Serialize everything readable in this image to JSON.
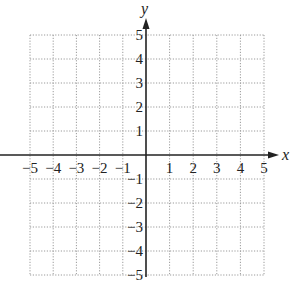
{
  "chart_data": {
    "type": "scatter",
    "title": "",
    "xlabel": "x",
    "ylabel": "y",
    "xlim": [
      -5,
      5
    ],
    "ylim": [
      -5,
      5
    ],
    "grid": true,
    "grid_style": "dotted",
    "x_ticks": [
      -5,
      -4,
      -3,
      -2,
      -1,
      1,
      2,
      3,
      4,
      5
    ],
    "y_ticks": [
      -5,
      -4,
      -3,
      -2,
      -1,
      1,
      2,
      3,
      4,
      5
    ],
    "x_tick_labels": [
      "−5",
      "−4",
      "−3",
      "−2",
      "−1",
      "1",
      "2",
      "3",
      "4",
      "5"
    ],
    "y_tick_labels": [
      "−5",
      "−4",
      "−3",
      "−2",
      "−1",
      "1",
      "2",
      "3",
      "4",
      "5"
    ],
    "series": [],
    "legend": null
  },
  "layout": {
    "grid_left": 30,
    "grid_right": 264,
    "grid_top": 35,
    "grid_bottom": 275,
    "origin_x": 146,
    "origin_y": 155,
    "axis_color": "#222222",
    "grid_color": "#9a9a9a"
  }
}
